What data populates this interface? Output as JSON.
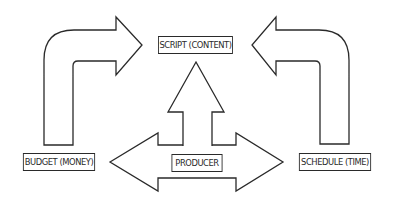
{
  "diagram": {
    "nodes": {
      "script": {
        "label": "SCRIPT (CONTENT)"
      },
      "producer": {
        "label": "PRODUCER"
      },
      "budget": {
        "label": "BUDGET (MONEY)"
      },
      "schedule": {
        "label": "SCHEDULE (TIME)"
      }
    },
    "edges": [
      {
        "from": "budget",
        "to": "script",
        "style": "bent-arrow"
      },
      {
        "from": "schedule",
        "to": "script",
        "style": "bent-arrow"
      },
      {
        "from": "producer",
        "to": "script",
        "style": "block-arrow-up"
      },
      {
        "from": "producer",
        "to": [
          "budget",
          "schedule"
        ],
        "style": "double-block-arrow"
      }
    ],
    "colors": {
      "stroke": "#2a2a2a",
      "fill": "#ffffff",
      "background": "#ffffff"
    }
  }
}
